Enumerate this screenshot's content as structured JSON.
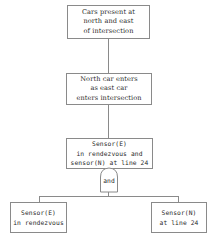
{
  "diagram": {
    "type": "fault-tree",
    "nodes": [
      {
        "id": "top",
        "lines": [
          "Cars present at",
          "north and east",
          "of intersection"
        ]
      },
      {
        "id": "middle",
        "lines": [
          "North car enters",
          "as east car",
          "enters intersection"
        ]
      },
      {
        "id": "sensor-event",
        "lines": [
          "Sensor(E)",
          "in rendezvous and",
          "sensor(N) at line 24"
        ]
      },
      {
        "id": "leaf-left",
        "lines": [
          "Sensor(E)",
          "in rendezvous"
        ]
      },
      {
        "id": "leaf-right",
        "lines": [
          "Sensor(N)",
          "at line 24"
        ]
      }
    ],
    "gate": {
      "type": "and",
      "label": "and"
    },
    "edges": [
      [
        "top",
        "middle"
      ],
      [
        "middle",
        "sensor-event"
      ],
      [
        "sensor-event",
        "and-gate"
      ],
      [
        "and-gate",
        "leaf-left"
      ],
      [
        "and-gate",
        "leaf-right"
      ]
    ]
  }
}
